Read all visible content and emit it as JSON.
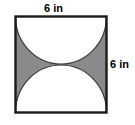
{
  "figure": {
    "shape": "square",
    "shaded_color": "#8a8a8a",
    "unshaded_color": "#ffffff",
    "outline_color": "#1a1a1a",
    "labels": {
      "top": "6 in",
      "right": "6 in"
    },
    "dimensions": {
      "side_length_value": 6,
      "units": "in",
      "width_label": "6 in",
      "height_label": "6 in"
    },
    "regions": [
      {
        "name": "upper-semicircle",
        "description": "white semicircle with diameter on the top edge, bulging downward",
        "fill": "#ffffff",
        "diameter": "6 in",
        "radius": "3 in"
      },
      {
        "name": "lower-semicircle",
        "description": "white semicircle with diameter on the bottom edge, bulging upward",
        "fill": "#ffffff",
        "diameter": "6 in",
        "radius": "3 in"
      },
      {
        "name": "shaded-corners",
        "description": "four gray corner regions of the square left over outside the two semicircles",
        "fill": "#8a8a8a"
      }
    ]
  }
}
